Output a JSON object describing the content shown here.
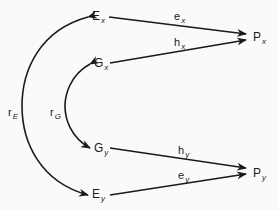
{
  "diagram": {
    "type": "path-diagram",
    "nodes": {
      "Ex": {
        "base": "E",
        "sub": "x"
      },
      "Gx": {
        "base": "G",
        "sub": "x"
      },
      "Gy": {
        "base": "G",
        "sub": "y"
      },
      "Ey": {
        "base": "E",
        "sub": "y"
      },
      "Px": {
        "base": "P",
        "sub": "x"
      },
      "Py": {
        "base": "P",
        "sub": "y"
      }
    },
    "edges": {
      "ex": {
        "base": "e",
        "sub": "x",
        "from": "Ex",
        "to": "Px"
      },
      "hx": {
        "base": "h",
        "sub": "x",
        "from": "Gx",
        "to": "Px"
      },
      "hy": {
        "base": "h",
        "sub": "y",
        "from": "Gy",
        "to": "Py"
      },
      "ey": {
        "base": "e",
        "sub": "y",
        "from": "Ey",
        "to": "Py"
      }
    },
    "correlations": {
      "rE": {
        "base": "r",
        "sub": "E",
        "between": [
          "Ex",
          "Ey"
        ]
      },
      "rG": {
        "base": "r",
        "sub": "G",
        "between": [
          "Gx",
          "Gy"
        ]
      }
    },
    "line_color": "#1a1a1a"
  }
}
